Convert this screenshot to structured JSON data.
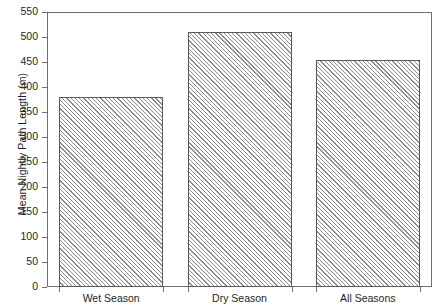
{
  "chart_data": {
    "type": "bar",
    "title": "",
    "xlabel": "",
    "ylabel": "Mean Nightly Path Length (m)",
    "categories": [
      "Wet Season",
      "Dry Season",
      "All Seasons"
    ],
    "values": [
      380,
      511,
      455
    ],
    "ylim": [
      0,
      550
    ],
    "ytick_step": 50,
    "yticks": [
      0,
      50,
      100,
      150,
      200,
      250,
      300,
      350,
      400,
      450,
      500,
      550
    ],
    "ytick_labels": [
      "0",
      "50",
      "100",
      "150",
      "200",
      "250",
      "300",
      "350",
      "400",
      "450",
      "500",
      "550"
    ],
    "grid": false,
    "legend": null,
    "bar_fill": "hatch-diagonal-45",
    "bar_edge_color": "#5a5a5a",
    "frame_color": "#6e6e6e",
    "background": "#ffffff"
  },
  "axis": {
    "y_title": "Mean Nightly Path Length (m)"
  },
  "bars": [
    {
      "label": "Wet Season",
      "value": 380
    },
    {
      "label": "Dry Season",
      "value": 511
    },
    {
      "label": "All Seasons",
      "value": 455
    }
  ]
}
